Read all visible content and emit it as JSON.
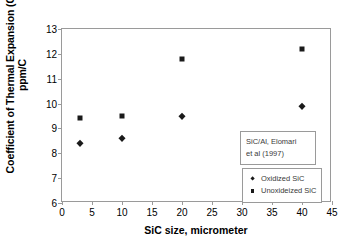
{
  "chart_data": {
    "type": "scatter",
    "title": "",
    "xlabel": "SiC size, micrometer",
    "ylabel_lines": [
      "Coefficient of Thermal Expansion (CTE),",
      "ppm/C"
    ],
    "ylabel": "Coefficient of Thermal Expansion (CTE), ppm/C",
    "xlim": [
      0,
      45
    ],
    "ylim": [
      6,
      13
    ],
    "xticks": [
      0,
      5,
      10,
      15,
      20,
      25,
      30,
      35,
      40,
      45
    ],
    "yticks": [
      6,
      7,
      8,
      9,
      10,
      11,
      12,
      13
    ],
    "grid": false,
    "legend_position": "inside-bottom-right",
    "annotation": {
      "lines": [
        "SiC/Al, Elomari",
        "et al (1997)"
      ],
      "text": "SiC/Al, Elomari et al (1997)"
    },
    "series": [
      {
        "name": "Oxidized SiC",
        "marker": "diamond",
        "color": "#1a1a1a",
        "x": [
          3,
          10,
          20,
          40
        ],
        "values": [
          8.4,
          8.6,
          9.5,
          9.9
        ],
        "points": [
          {
            "x": 3,
            "y": 8.4
          },
          {
            "x": 10,
            "y": 8.6
          },
          {
            "x": 20,
            "y": 9.5
          },
          {
            "x": 40,
            "y": 9.9
          }
        ]
      },
      {
        "name": "Unoxideized SiC",
        "marker": "square",
        "color": "#1a1a1a",
        "x": [
          3,
          10,
          20,
          40
        ],
        "values": [
          9.4,
          9.5,
          11.8,
          12.2
        ],
        "points": [
          {
            "x": 3,
            "y": 9.4
          },
          {
            "x": 10,
            "y": 9.5
          },
          {
            "x": 20,
            "y": 11.8
          },
          {
            "x": 40,
            "y": 12.2
          }
        ]
      }
    ]
  },
  "colors": {
    "marker": "#1a1a1a",
    "axis": "#9a9a9a",
    "text": "#000000",
    "box_text": "#3a3a3a",
    "background": "#ffffff"
  }
}
